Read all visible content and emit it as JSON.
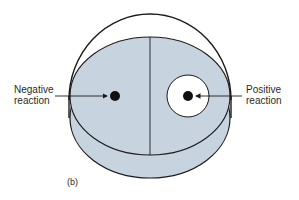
{
  "figure": {
    "caption": "(b)",
    "colors": {
      "agar": "#c7d3de",
      "outline": "#1a1a1a",
      "background": "#ffffff",
      "zone": "#ffffff"
    }
  },
  "labels": {
    "negative": {
      "line1": "Negative",
      "line2": "reaction"
    },
    "positive": {
      "line1": "Positive",
      "line2": "reaction"
    }
  },
  "parts": {
    "dish": "petri-dish",
    "divider": "center-divider-line",
    "negative_spot": "colony-no-clear-zone",
    "positive_spot": "colony-with-clear-zone"
  }
}
